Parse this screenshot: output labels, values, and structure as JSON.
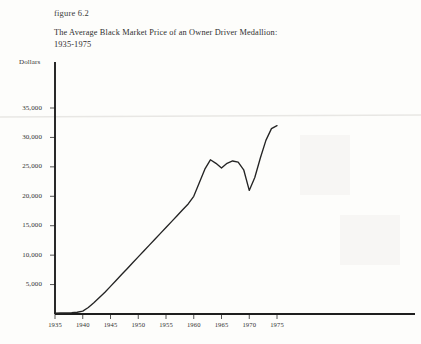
{
  "figure": {
    "number": "figure 6.2",
    "title": "The Average Black Market Price of an Owner Driver Medallion:\n1935-1975"
  },
  "chart_data": {
    "type": "line",
    "title": "The Average Black Market Price of an Owner Driver Medallion: 1935-1975",
    "xlabel": "",
    "ylabel": "Dollars",
    "ylim": [
      0,
      38000
    ],
    "xlim": [
      1935,
      1978
    ],
    "grid": false,
    "legend": false,
    "yticks": [
      5000,
      10000,
      15000,
      20000,
      25000,
      30000,
      35000
    ],
    "ytick_labels": [
      "5,000",
      "10,000",
      "15,000",
      "20,000",
      "25,000",
      "30,000",
      "35,000"
    ],
    "xticks": [
      1935,
      1940,
      1945,
      1950,
      1955,
      1960,
      1965,
      1970,
      1975
    ],
    "xtick_labels": [
      "1935",
      "1940",
      "1945",
      "1950",
      "1955",
      "1960",
      "1965",
      "1970",
      "1975"
    ],
    "series": [
      {
        "name": "Average black market medallion price",
        "x": [
          1935,
          1936,
          1937,
          1938,
          1939,
          1940,
          1941,
          1942,
          1943,
          1944,
          1945,
          1946,
          1947,
          1948,
          1949,
          1950,
          1951,
          1952,
          1953,
          1954,
          1955,
          1956,
          1957,
          1958,
          1959,
          1960,
          1961,
          1962,
          1963,
          1964,
          1965,
          1966,
          1967,
          1968,
          1969,
          1970,
          1971,
          1972,
          1973,
          1974,
          1975
        ],
        "values": [
          150,
          170,
          200,
          240,
          300,
          500,
          1100,
          1900,
          2800,
          3700,
          4700,
          5700,
          6700,
          7700,
          8700,
          9700,
          10700,
          11700,
          12700,
          13700,
          14700,
          15700,
          16700,
          17700,
          18700,
          20000,
          22300,
          24600,
          26200,
          25600,
          24800,
          25600,
          26000,
          25800,
          24500,
          21000,
          23200,
          26500,
          29500,
          31500,
          32000
        ]
      }
    ]
  }
}
